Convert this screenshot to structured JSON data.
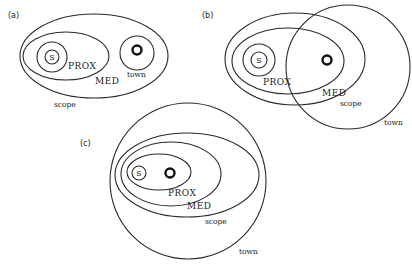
{
  "panels": [
    {
      "id": "a",
      "label": "(a)",
      "regions": {
        "scope": "scope",
        "med": "MED",
        "prox": "PROX",
        "s": "S",
        "town": "town"
      },
      "relation": "town inside scope, outside MED"
    },
    {
      "id": "b",
      "label": "(b)",
      "regions": {
        "scope": "scope",
        "med": "MED",
        "prox": "PROX",
        "s": "S",
        "town": "town"
      },
      "relation": "town overlaps scope and MED"
    },
    {
      "id": "c",
      "label": "(c)",
      "regions": {
        "scope": "scope",
        "med": "MED",
        "prox": "PROX",
        "s": "S",
        "town": "town"
      },
      "relation": "town contains scope; town centre inside PROX"
    }
  ],
  "colors": {
    "line": "#2a2a2a",
    "ring": "#111111",
    "background": "#ffffff"
  }
}
